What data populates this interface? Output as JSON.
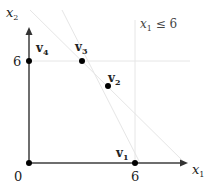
{
  "diagram": {
    "axes": {
      "x_label": "x",
      "x_sub": "1",
      "y_label": "x",
      "y_sub": "2",
      "origin_label": "0",
      "x_tick": "6",
      "y_tick": "6",
      "axis_color": "#6e6e6e"
    },
    "constraint": {
      "text_var": "x",
      "text_sub": "1",
      "text_rel": " ≤ 6"
    },
    "vertices": [
      {
        "name": "v",
        "sub": "1"
      },
      {
        "name": "v",
        "sub": "2"
      },
      {
        "name": "v",
        "sub": "3"
      },
      {
        "name": "v",
        "sub": "4"
      }
    ],
    "colors": {
      "point": "#000000",
      "faint_line": "#e6e6e6"
    }
  }
}
